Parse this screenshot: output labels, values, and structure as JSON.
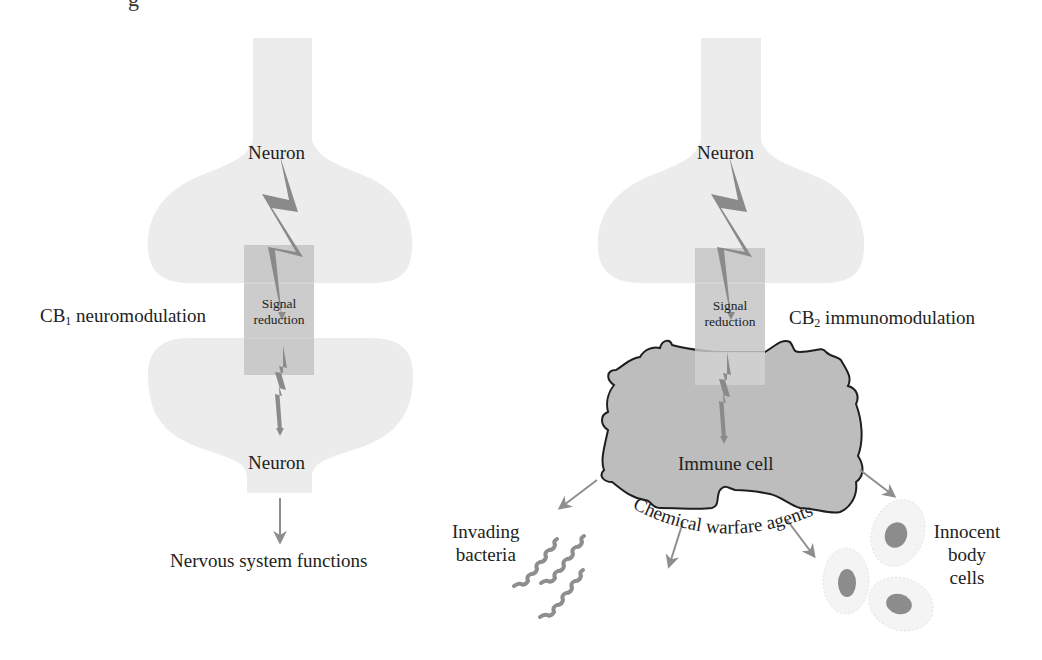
{
  "figure": {
    "top_cropped_text": "g",
    "colors": {
      "neuron_fill": "#ececec",
      "signal_box": "#c9c9c9",
      "immune_cell_fill": "#bdbdbd",
      "immune_cell_outline": "#1e1e1e",
      "lightning": "#8a8a8a",
      "arrow": "#8e8e8e",
      "bacteria": "#8e8e8e",
      "body_cell_fill": "#f3f3f3",
      "body_cell_nucleus": "#8c8c8c",
      "text": "#222222"
    }
  },
  "left_panel": {
    "upper_neuron_label": "Neuron",
    "signal_box_line1": "Signal",
    "signal_box_line2": "reduction",
    "modulation_prefix": "CB",
    "modulation_subscript": "1",
    "modulation_suffix": " neuromodulation",
    "lower_neuron_label": "Neuron",
    "output_label": "Nervous system functions"
  },
  "right_panel": {
    "upper_neuron_label": "Neuron",
    "signal_box_line1": "Signal",
    "signal_box_line2": "reduction",
    "modulation_prefix": "CB",
    "modulation_subscript": "2",
    "modulation_suffix": " immunomodulation",
    "immune_cell_label": "Immune cell",
    "bacteria_label_line1": "Invading",
    "bacteria_label_line2": "bacteria",
    "chemical_label": "Chemical warfare agents",
    "body_cells_line1": "Innocent",
    "body_cells_line2": "body",
    "body_cells_line3": "cells"
  }
}
